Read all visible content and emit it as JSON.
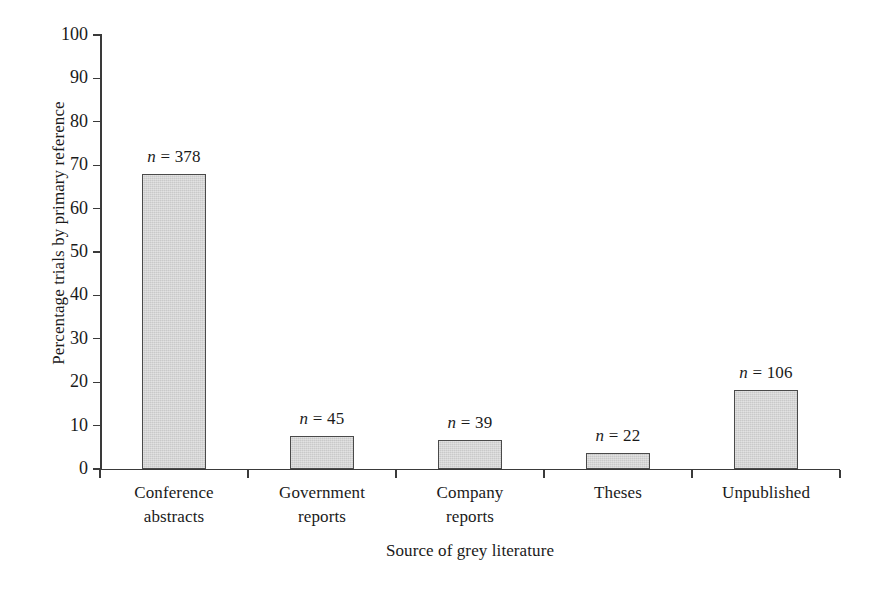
{
  "chart_data": {
    "type": "bar",
    "title": "",
    "subtitle": "",
    "xlabel": "Source of grey literature",
    "ylabel": "Percentage trials by primary reference",
    "categories": [
      "Conference abstracts",
      "Government reports",
      "Company reports",
      "Theses",
      "Unpublished"
    ],
    "category_lines": [
      [
        "Conference",
        "abstracts"
      ],
      [
        "Government",
        "reports"
      ],
      [
        "Company",
        "reports"
      ],
      [
        "Theses"
      ],
      [
        "Unpublished"
      ]
    ],
    "values": [
      68.0,
      7.6,
      6.6,
      3.6,
      18.3
    ],
    "point_labels": [
      "n = 378",
      "n = 45",
      "n = 39",
      "n = 22",
      "n = 106"
    ],
    "n_values": [
      378,
      45,
      39,
      22,
      106
    ],
    "ylim": [
      0,
      100
    ],
    "yticks": [
      0,
      10,
      20,
      30,
      40,
      50,
      60,
      70,
      80,
      90,
      100
    ],
    "ytick_labels": [
      "0",
      "10",
      "20",
      "30",
      "40",
      "50",
      "60",
      "70",
      "80",
      "90",
      "100"
    ],
    "grid": false,
    "legend": "none",
    "bar_fill_color": "#c9c9c9",
    "bar_edge_color": "#4a4a4a",
    "axis_color": "#3a3a3a",
    "background_color": "#ffffff",
    "annotation_prefix": "n",
    "annotation_separator": "="
  }
}
